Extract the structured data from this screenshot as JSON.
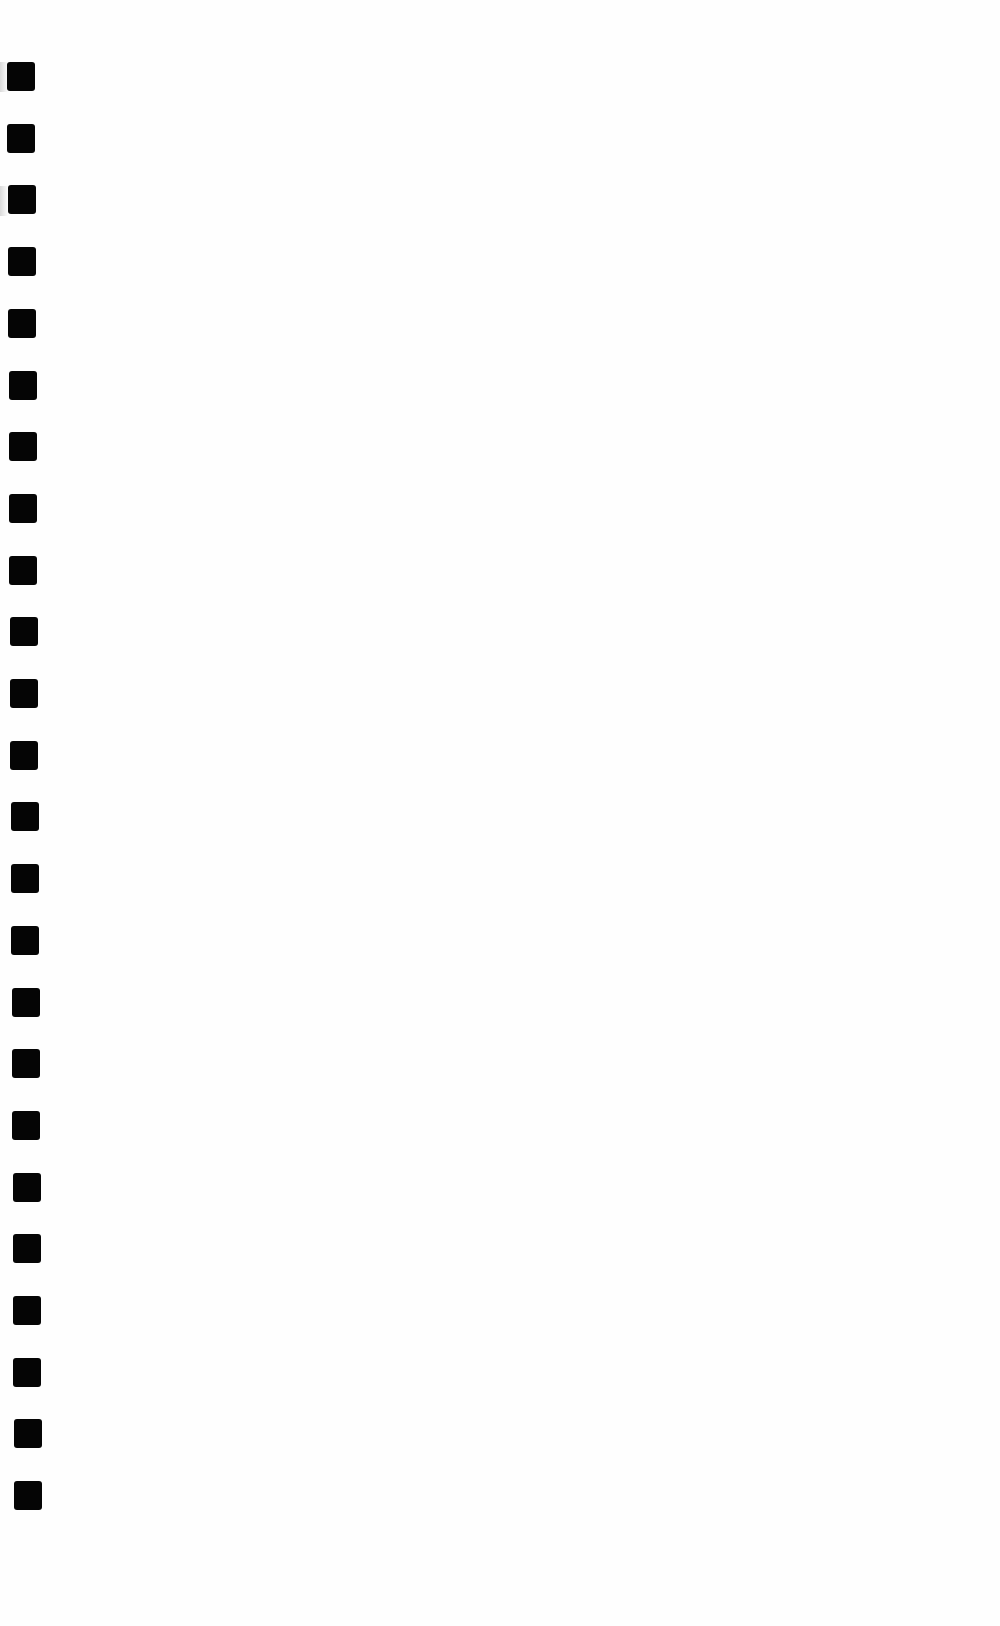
{
  "page": {
    "background": "#fefefe",
    "content_text": ""
  },
  "margin_marks": {
    "count": 24,
    "color": "#050505",
    "size": [
      28,
      29
    ],
    "first_top": 62,
    "spacing": 61.7,
    "x_start": 7,
    "x_end": 14
  }
}
